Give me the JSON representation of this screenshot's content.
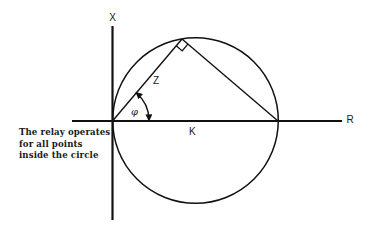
{
  "diagram": {
    "labels": {
      "x_axis": "X",
      "r_axis": "R",
      "impedance": "Z",
      "angle": "φ",
      "diameter": "K"
    },
    "annotation": [
      "The relay operates",
      "for all points",
      "inside the circle"
    ],
    "geometry": {
      "characteristic": "circle through origin with diameter K along R axis",
      "right_angle_marker": true,
      "angle_arrows": "both ends"
    },
    "colors": {
      "line": "#111111",
      "background": "#ffffff"
    }
  }
}
